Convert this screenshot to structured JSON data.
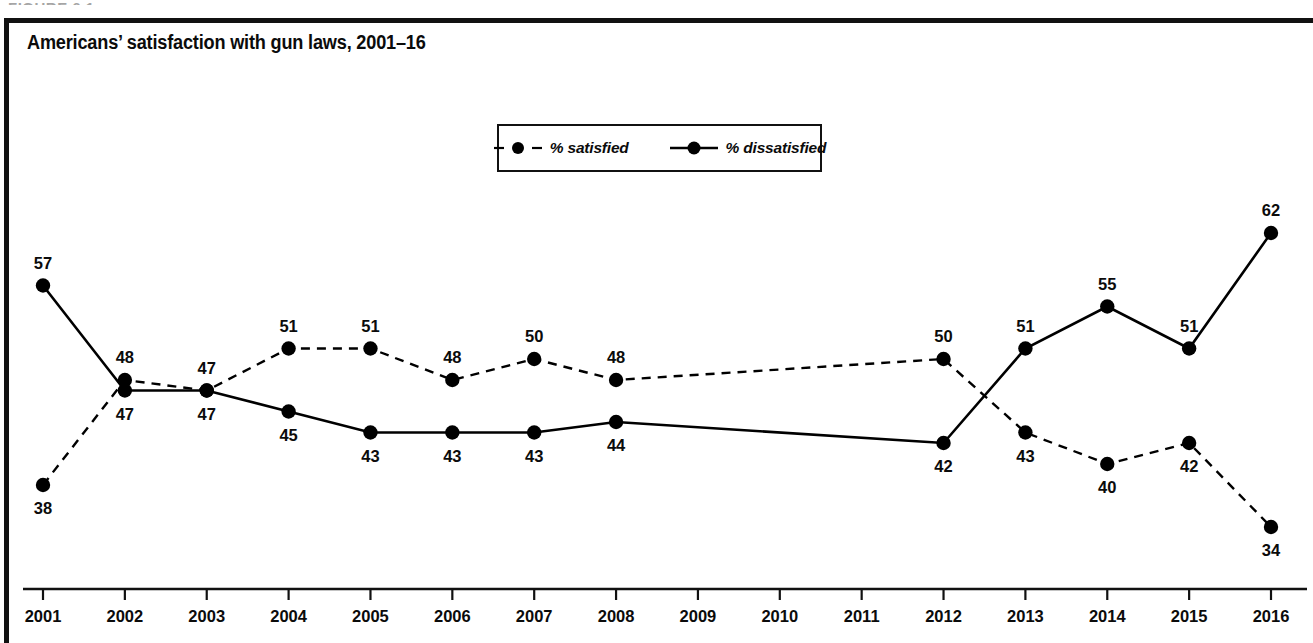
{
  "figure": {
    "caption_remnant": "FIGURE 6.1",
    "title": "Americans’ satisfaction with gun laws, 2001–16"
  },
  "legend": {
    "position": "top-center-inside",
    "entries": [
      {
        "label": "% satisfied",
        "style": "dashed",
        "marker": "filled-circle",
        "color": "#000000"
      },
      {
        "label": "% dissatisfied",
        "style": "solid",
        "marker": "filled-circle",
        "color": "#000000"
      }
    ]
  },
  "chart_data": {
    "type": "line",
    "title": "Americans’ satisfaction with gun laws, 2001–16",
    "xlabel": "",
    "ylabel": "",
    "grid": false,
    "legend_position": "top-center",
    "ylim": [
      30,
      66
    ],
    "categories": [
      "2001",
      "2002",
      "2003",
      "2004",
      "2005",
      "2006",
      "2007",
      "2008",
      "2009",
      "2010",
      "2011",
      "2012",
      "2013",
      "2014",
      "2015",
      "2016"
    ],
    "tick_labels": [
      "2001",
      "2002",
      "2003",
      "2004",
      "2005",
      "2006",
      "2007",
      "2008",
      "2009",
      "2010",
      "2011",
      "2012",
      "2013",
      "2014",
      "2015",
      "2016"
    ],
    "series": [
      {
        "name": "% satisfied",
        "style": "dashed",
        "values": [
          38,
          48,
          47,
          51,
          51,
          48,
          50,
          48,
          null,
          null,
          null,
          50,
          43,
          40,
          42,
          34
        ],
        "label_positions": [
          "below",
          "above",
          "above",
          "above",
          "above",
          "above",
          "above",
          "above",
          null,
          null,
          null,
          "above",
          "below",
          "below",
          "below",
          "below"
        ]
      },
      {
        "name": "% dissatisfied",
        "style": "solid",
        "values": [
          57,
          47,
          47,
          45,
          43,
          43,
          43,
          44,
          null,
          null,
          null,
          42,
          51,
          55,
          51,
          62
        ],
        "label_positions": [
          "above",
          "below",
          "below",
          "below",
          "below",
          "below",
          "below",
          "below",
          null,
          null,
          null,
          "below",
          "above",
          "above",
          "above",
          "above"
        ]
      }
    ]
  },
  "axis": {
    "tick_count": 16,
    "axis_line_color": "#111111"
  }
}
